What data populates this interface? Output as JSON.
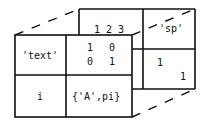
{
  "diagram": {
    "type": "3d-cell-array",
    "front_page": {
      "cells": [
        {
          "row": 1,
          "col": 1,
          "label": "'text'"
        },
        {
          "row": 1,
          "col": 2,
          "matrix": [
            [
              "1",
              "0"
            ],
            [
              "0",
              "1"
            ]
          ]
        },
        {
          "row": 2,
          "col": 1,
          "label": "i"
        },
        {
          "row": 2,
          "col": 2,
          "label": "{'A',pi}"
        }
      ]
    },
    "back_page": {
      "cells": [
        {
          "row": 1,
          "col": 1,
          "label": "1 2 3"
        },
        {
          "row": 1,
          "col": 2,
          "label": "'sp'"
        },
        {
          "row": 2,
          "col": 2,
          "diag": [
            "1",
            "1"
          ]
        }
      ]
    },
    "colors": {
      "line": "#111111",
      "background": "#ffffff"
    }
  }
}
